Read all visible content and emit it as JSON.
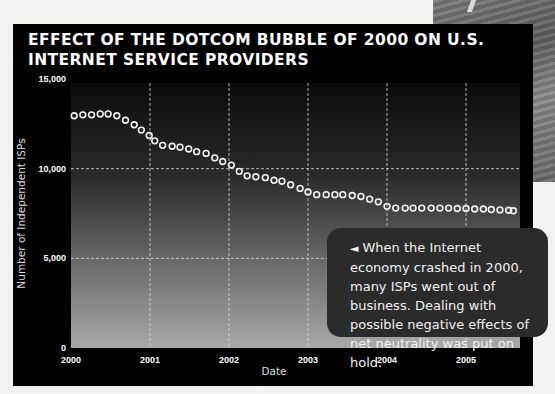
{
  "title": "EFFECT OF THE DOTCOM BUBBLE OF 2000 ON U.S. INTERNET SERVICE PROVIDERS",
  "callout": {
    "arrow_icon": "◄",
    "text": "When the Internet economy crashed in 2000, many ISPs went out of business. Dealing with possible negative effects of net neutrality was put on hold."
  },
  "colors": {
    "panel": "#000000",
    "marker_stroke": "#f0f0f0",
    "grid": "#d8d8d8",
    "callout_bg": "#2b2b2b"
  },
  "chart_data": {
    "type": "scatter",
    "title": "EFFECT OF THE DOTCOM BUBBLE OF 2000 ON U.S. INTERNET SERVICE PROVIDERS",
    "xlabel": "Date",
    "ylabel": "Number of Independent ISPs",
    "xlim": [
      2000,
      2005.7
    ],
    "ylim": [
      0,
      15000
    ],
    "x_ticks": [
      2000,
      2001,
      2002,
      2003,
      2004,
      2005
    ],
    "x_tick_labels": [
      "2000",
      "2001",
      "2002",
      "2003",
      "2004",
      "2005"
    ],
    "y_ticks": [
      0,
      5000,
      10000,
      15000
    ],
    "y_tick_labels": [
      "0",
      "5,000",
      "10,000",
      "15,000"
    ],
    "grid": true,
    "marker": "hollow-circle",
    "series": [
      {
        "name": "Independent ISPs",
        "x": [
          2000.04,
          2000.15,
          2000.26,
          2000.37,
          2000.47,
          2000.58,
          2000.69,
          2000.8,
          2000.89,
          2000.99,
          2001.06,
          2001.16,
          2001.28,
          2001.38,
          2001.49,
          2001.59,
          2001.71,
          2001.82,
          2001.92,
          2002.03,
          2002.13,
          2002.23,
          2002.34,
          2002.46,
          2002.57,
          2002.67,
          2002.78,
          2002.9,
          2003.0,
          2003.11,
          2003.23,
          2003.34,
          2003.44,
          2003.56,
          2003.67,
          2003.78,
          2003.89,
          2004.0,
          2004.11,
          2004.23,
          2004.33,
          2004.44,
          2004.56,
          2004.67,
          2004.78,
          2004.89,
          2005.0,
          2005.11,
          2005.22,
          2005.32,
          2005.43,
          2005.54,
          2005.6
        ],
        "values": [
          12950,
          13000,
          13000,
          13050,
          13050,
          12950,
          12700,
          12450,
          12150,
          11850,
          11550,
          11300,
          11250,
          11200,
          11100,
          10950,
          10850,
          10600,
          10400,
          10200,
          9850,
          9600,
          9550,
          9500,
          9350,
          9300,
          9100,
          8900,
          8700,
          8550,
          8550,
          8550,
          8550,
          8500,
          8450,
          8300,
          8150,
          7900,
          7800,
          7800,
          7800,
          7800,
          7800,
          7800,
          7800,
          7780,
          7780,
          7750,
          7750,
          7720,
          7700,
          7680,
          7650
        ]
      }
    ]
  }
}
